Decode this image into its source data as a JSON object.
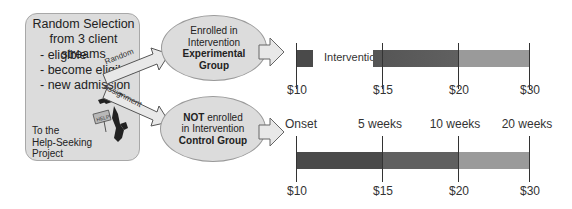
{
  "selection_box": {
    "title_line1": "Random Selection",
    "title_line2": "from 3 client streams",
    "streams": [
      "- eligible",
      "- become eligible",
      "- new admission"
    ],
    "footer_line1": "To the",
    "footer_line2": "Help-Seeking",
    "footer_line3": "Project",
    "clipart_sign": "HELP!"
  },
  "arrows": {
    "upper_label": "Random",
    "lower_label": "Assignment"
  },
  "experimental": {
    "line1": "Enrolled in",
    "line2": "Intervention",
    "line3": "Experimental",
    "line4": "Group"
  },
  "control": {
    "line1_bold": "NOT",
    "line1_rest": " enrolled",
    "line2": "in Intervention",
    "line3": "Control Group"
  },
  "timeline": {
    "intervention_label": "Intervention",
    "week_labels": [
      "Onset",
      "5 weeks",
      "10 weeks",
      "20 weeks"
    ],
    "payment_labels_top": [
      "$10",
      "$15",
      "$20",
      "$30"
    ],
    "payment_labels_bottom": [
      "$10",
      "$15",
      "$20",
      "$30"
    ],
    "colors": {
      "segment1": "#4a4a4a",
      "segment2": "#606060",
      "segment3": "#9a9a9a",
      "tick": "#333333"
    }
  }
}
